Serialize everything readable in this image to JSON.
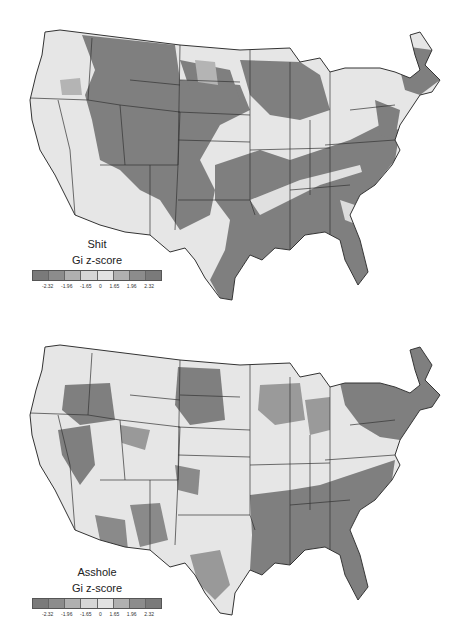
{
  "maps": [
    {
      "term": "Shit",
      "legend_label": "Gi z-score"
    },
    {
      "term": "Asshole",
      "legend_label": "Gi z-score"
    }
  ],
  "legend": {
    "ticks": [
      "-2.32",
      "-1.96",
      "-1.65",
      "0",
      "1.65",
      "1.96",
      "2.32"
    ],
    "colors": [
      "#7a7a7a",
      "#8c8c8c",
      "#b0b0b0",
      "#d6d6d6",
      "#e2e2e2",
      "#b0b0b0",
      "#8c8c8c",
      "#7a7a7a"
    ]
  },
  "colors": {
    "base": "#e6e6e6",
    "hot": "#7f7f7f",
    "mid": "#b4b4b4",
    "border": "#333333"
  }
}
